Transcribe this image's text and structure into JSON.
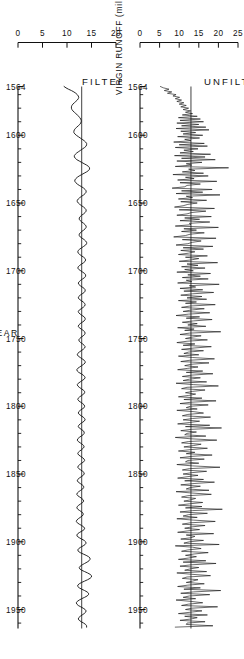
{
  "figure": {
    "orientation_note": "rotated",
    "y_axis_title": "VIRGIN RUNOFF (million ac-ft)",
    "x_axis_title": "YEAR",
    "panels": [
      {
        "id": "unfiltered",
        "title": "UNFILTERED"
      },
      {
        "id": "filtered",
        "title": "FILTERED"
      }
    ]
  },
  "chart_data": {
    "type": "line",
    "title": "",
    "xlabel": "YEAR",
    "ylabel": "VIRGIN RUNOFF (million ac-ft)",
    "xlim": [
      1564,
      1964
    ],
    "grid": false,
    "legend": null,
    "x_ticks": [
      1564,
      1600,
      1650,
      1700,
      1750,
      1800,
      1850,
      1900,
      1950
    ],
    "x_tick_labels": [
      "1564",
      "1600",
      "1650",
      "1700",
      "1750",
      "1800",
      "1850",
      "1900",
      "1950"
    ],
    "x_minor_tick_step": 10,
    "panels": [
      {
        "name": "UNFILTERED",
        "ylim": [
          0,
          25
        ],
        "y_ticks": [
          0,
          5,
          10,
          15,
          20,
          25
        ],
        "y_tick_labels": [
          "0",
          "5",
          "10",
          "15",
          "20",
          "25"
        ],
        "mean_level": 13.0,
        "x_start": 1564,
        "x_step": 1,
        "values": [
          5.2,
          6.0,
          7.4,
          6.2,
          8.1,
          7.0,
          9.2,
          8.4,
          10.1,
          9.0,
          10.6,
          9.4,
          11.2,
          10.0,
          11.8,
          10.4,
          12.4,
          11.0,
          12.9,
          11.6,
          13.4,
          10.8,
          14.6,
          9.8,
          15.4,
          10.2,
          16.2,
          9.4,
          15.0,
          10.6,
          16.8,
          9.2,
          17.6,
          10.4,
          14.2,
          11.0,
          16.0,
          9.6,
          15.2,
          11.4,
          13.0,
          8.6,
          16.4,
          10.0,
          17.2,
          9.0,
          14.8,
          11.2,
          13.6,
          10.2,
          18.0,
          8.8,
          16.6,
          10.6,
          19.2,
          9.4,
          15.8,
          11.8,
          13.2,
          9.0,
          22.6,
          12.4,
          14.0,
          10.8,
          16.2,
          8.4,
          17.4,
          11.6,
          13.8,
          9.6,
          19.6,
          10.2,
          15.4,
          12.0,
          11.4,
          8.2,
          18.4,
          10.6,
          16.0,
          9.2,
          20.4,
          11.8,
          13.4,
          9.8,
          17.0,
          10.4,
          14.6,
          12.2,
          11.0,
          8.8,
          19.0,
          10.0,
          16.8,
          13.2,
          12.0,
          9.4,
          18.2,
          11.4,
          15.2,
          10.2,
          17.8,
          12.6,
          13.0,
          9.0,
          20.0,
          11.2,
          14.4,
          10.6,
          16.4,
          12.8,
          11.6,
          8.6,
          19.4,
          10.8,
          15.6,
          13.4,
          12.2,
          9.2,
          18.6,
          11.0,
          16.2,
          10.4,
          14.0,
          12.4,
          9.8,
          17.2,
          11.6,
          15.0,
          13.0,
          10.0,
          19.8,
          12.0,
          14.8,
          10.6,
          16.6,
          11.4,
          13.6,
          9.4,
          18.0,
          12.2,
          15.4,
          10.8,
          17.4,
          11.8,
          13.2,
          9.6,
          20.2,
          12.6,
          14.2,
          10.2,
          16.0,
          11.2,
          18.8,
          13.4,
          10.4,
          15.8,
          12.0,
          17.0,
          9.8,
          14.4,
          11.6,
          19.2,
          12.8,
          10.6,
          16.4,
          13.0,
          11.0,
          17.8,
          12.4,
          9.2,
          15.2,
          11.8,
          18.4,
          13.6,
          10.8,
          14.6,
          12.2,
          16.8,
          9.6,
          13.8,
          11.4,
          20.6,
          12.6,
          10.2,
          15.6,
          13.2,
          11.6,
          17.2,
          12.0,
          9.4,
          14.0,
          11.0,
          18.2,
          13.8,
          10.6,
          16.2,
          12.4,
          11.2,
          15.0,
          9.8,
          13.4,
          19.0,
          12.8,
          10.4,
          17.6,
          13.0,
          11.4,
          14.8,
          12.2,
          9.6,
          16.0,
          11.8,
          18.6,
          13.2,
          10.8,
          15.4,
          12.6,
          11.0,
          17.0,
          9.2,
          13.6,
          20.0,
          12.0,
          10.6,
          16.6,
          13.4,
          11.6,
          14.2,
          12.4,
          9.8,
          15.8,
          11.2,
          19.4,
          13.0,
          10.2,
          17.4,
          12.8,
          11.8,
          14.6,
          9.4,
          13.8,
          16.2,
          12.2,
          10.8,
          18.0,
          13.4,
          11.0,
          15.2,
          12.6,
          9.6,
          17.8,
          11.6,
          20.8,
          13.2,
          10.4,
          14.4,
          12.0,
          11.4,
          16.8,
          9.0,
          13.0,
          19.6,
          12.4,
          10.6,
          15.6,
          13.6,
          11.2,
          17.2,
          12.8,
          9.8,
          14.0,
          11.8,
          18.4,
          13.0,
          10.2,
          16.4,
          12.2,
          11.6,
          15.0,
          9.4,
          13.4,
          20.4,
          12.6,
          10.8,
          17.0,
          13.2,
          11.0,
          14.8,
          12.0,
          9.6,
          16.2,
          11.4,
          19.0,
          13.8,
          10.4,
          15.4,
          12.8,
          11.8,
          17.6,
          9.2,
          13.2,
          18.2,
          12.2,
          10.6,
          14.2,
          13.0,
          11.2,
          16.0,
          12.6,
          9.8,
          15.8,
          11.6,
          21.0,
          13.4,
          10.2,
          17.2,
          12.4,
          11.0,
          14.6,
          9.4,
          13.6,
          19.2,
          12.8,
          10.8,
          16.6,
          13.2,
          11.4,
          15.2,
          12.0,
          9.6,
          18.8,
          11.8,
          14.0,
          13.0,
          10.4,
          16.2,
          12.6,
          11.2,
          20.2,
          9.0,
          13.4,
          15.6,
          12.2,
          10.6,
          17.4,
          13.8,
          11.6,
          14.4,
          12.4,
          9.8,
          16.8,
          11.0,
          19.4,
          13.0,
          10.2,
          15.0,
          12.8,
          11.4,
          17.0,
          9.4,
          13.2,
          18.0,
          12.0,
          10.8,
          14.8,
          13.4,
          11.8,
          16.4,
          12.2,
          9.6,
          15.4,
          11.2,
          20.6,
          13.6,
          10.4,
          17.8,
          12.6,
          11.0,
          14.2,
          9.2,
          13.0,
          16.0,
          12.4,
          10.6,
          19.8,
          13.2,
          11.6,
          15.8,
          12.8,
          9.8,
          17.2,
          11.4,
          14.6,
          13.0,
          10.2,
          16.6,
          12.0,
          11.8,
          18.6,
          9.0
        ]
      },
      {
        "name": "FILTERED",
        "ylim": [
          0,
          20
        ],
        "y_ticks": [
          0,
          5,
          10,
          15,
          20
        ],
        "y_tick_labels": [
          "0",
          "5",
          "10",
          "15",
          "20"
        ],
        "mean_level": 13.0,
        "x_start": 1564,
        "x_step": 1,
        "values": [
          9.4,
          9.8,
          10.3,
          10.9,
          11.4,
          11.8,
          12.1,
          12.3,
          12.4,
          12.3,
          12.1,
          11.8,
          11.5,
          11.2,
          11.0,
          10.9,
          10.9,
          11.0,
          11.2,
          11.5,
          11.8,
          12.1,
          12.4,
          12.6,
          12.8,
          12.9,
          12.9,
          12.8,
          12.6,
          12.3,
          12.0,
          11.7,
          11.5,
          11.4,
          11.4,
          11.6,
          11.9,
          12.3,
          12.7,
          13.1,
          13.5,
          13.8,
          14.0,
          14.0,
          13.9,
          13.6,
          13.2,
          12.8,
          12.4,
          12.0,
          11.7,
          11.5,
          11.5,
          11.7,
          12.0,
          12.5,
          13.0,
          13.5,
          14.0,
          14.4,
          14.6,
          14.6,
          14.4,
          14.0,
          13.5,
          13.0,
          12.5,
          12.1,
          11.8,
          11.6,
          11.6,
          11.8,
          12.1,
          12.5,
          13.0,
          13.4,
          13.7,
          13.9,
          13.9,
          13.7,
          13.4,
          13.0,
          12.6,
          12.3,
          12.1,
          12.1,
          12.3,
          12.6,
          13.0,
          13.4,
          13.7,
          13.9,
          13.9,
          13.7,
          13.4,
          13.0,
          12.7,
          12.5,
          12.5,
          12.7,
          13.0,
          13.4,
          13.7,
          13.9,
          13.9,
          13.7,
          13.4,
          13.0,
          12.7,
          12.5,
          12.5,
          12.7,
          13.1,
          13.5,
          13.8,
          14.0,
          14.0,
          13.8,
          13.4,
          13.0,
          12.6,
          12.3,
          12.2,
          12.3,
          12.6,
          13.0,
          13.4,
          13.7,
          13.8,
          13.7,
          13.4,
          13.0,
          12.6,
          12.3,
          12.2,
          12.4,
          12.8,
          13.2,
          13.6,
          13.8,
          13.8,
          13.6,
          13.2,
          12.8,
          12.5,
          12.3,
          12.4,
          12.7,
          13.1,
          13.5,
          13.7,
          13.7,
          13.5,
          13.1,
          12.7,
          12.4,
          12.3,
          12.5,
          12.9,
          13.3,
          13.6,
          13.7,
          13.6,
          13.3,
          12.9,
          12.5,
          12.3,
          12.4,
          12.7,
          13.1,
          13.5,
          13.7,
          13.7,
          13.5,
          13.1,
          12.7,
          12.4,
          12.3,
          12.5,
          12.9,
          13.3,
          13.6,
          13.7,
          13.6,
          13.3,
          12.9,
          12.6,
          12.4,
          12.5,
          12.8,
          13.2,
          13.5,
          13.7,
          13.6,
          13.3,
          12.9,
          12.5,
          12.2,
          12.1,
          12.3,
          12.7,
          13.1,
          13.5,
          13.7,
          13.7,
          13.4,
          13.0,
          12.6,
          12.2,
          12.0,
          12.1,
          12.4,
          12.9,
          13.3,
          13.6,
          13.7,
          13.5,
          13.1,
          12.7,
          12.3,
          12.1,
          12.2,
          12.5,
          12.9,
          13.3,
          13.6,
          13.6,
          13.4,
          13.0,
          12.6,
          12.3,
          12.2,
          12.4,
          12.8,
          13.2,
          13.5,
          13.6,
          13.5,
          13.1,
          12.7,
          12.4,
          12.3,
          12.5,
          12.9,
          13.3,
          13.6,
          13.7,
          13.5,
          13.1,
          12.7,
          12.4,
          12.3,
          12.5,
          12.9,
          13.3,
          13.5,
          13.5,
          13.3,
          12.9,
          12.5,
          12.2,
          12.1,
          12.3,
          12.7,
          13.1,
          13.4,
          13.5,
          13.3,
          13.0,
          12.6,
          12.3,
          12.2,
          12.4,
          12.8,
          13.2,
          13.5,
          13.6,
          13.4,
          13.0,
          12.6,
          12.3,
          12.2,
          12.4,
          12.8,
          13.2,
          13.5,
          13.5,
          13.3,
          12.9,
          12.5,
          12.2,
          12.1,
          12.3,
          12.7,
          13.1,
          13.4,
          13.4,
          13.2,
          12.8,
          12.4,
          12.1,
          12.0,
          12.2,
          12.6,
          13.0,
          13.3,
          13.4,
          13.2,
          12.8,
          12.4,
          12.1,
          12.0,
          12.2,
          12.6,
          13.0,
          13.3,
          13.3,
          13.1,
          12.7,
          12.3,
          12.0,
          11.9,
          12.1,
          12.5,
          13.0,
          13.4,
          13.6,
          13.5,
          13.1,
          12.6,
          12.2,
          12.0,
          12.1,
          12.5,
          13.0,
          13.5,
          13.8,
          13.9,
          13.7,
          13.3,
          12.8,
          12.4,
          12.2,
          12.3,
          12.7,
          13.3,
          13.9,
          14.4,
          14.7,
          14.7,
          14.5,
          14.1,
          13.6,
          13.1,
          12.7,
          12.5,
          12.6,
          13.0,
          13.6,
          14.2,
          14.7,
          15.0,
          15.0,
          14.7,
          14.2,
          13.6,
          13.0,
          12.5,
          12.2,
          12.2,
          12.5,
          13.0,
          13.6,
          14.1,
          14.4,
          14.4,
          14.1,
          13.6,
          13.0,
          12.5,
          12.1,
          11.9,
          12.0,
          12.3,
          12.8,
          13.3,
          13.7,
          13.9,
          13.8,
          13.5,
          13.1,
          12.7,
          12.4,
          12.3,
          12.5,
          12.9,
          13.4,
          13.8,
          14.0,
          14.0
        ]
      }
    ]
  }
}
